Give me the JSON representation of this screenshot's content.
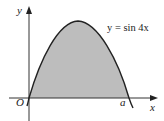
{
  "diagram": {
    "equation_label": "y = sin 4x",
    "axis_labels": {
      "x": "x",
      "y": "y"
    },
    "point_labels": {
      "origin": "O",
      "root": "a"
    },
    "colors": {
      "shade": "#bdbdbd",
      "curve": "#222222",
      "axis": "#333333"
    }
  }
}
